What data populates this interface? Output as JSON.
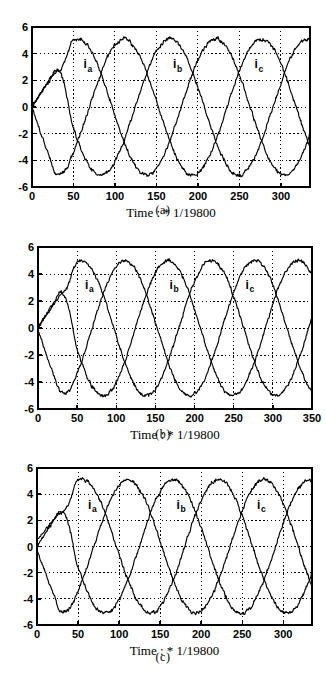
{
  "figure": {
    "type": "multi-panel-plot",
    "panel_count": 3,
    "background_color": "#ffffff",
    "line_color": "#000000",
    "grid_color": "#000000",
    "grid_style": "dotted"
  },
  "panels": [
    {
      "id": "a",
      "caption": "(a)",
      "xlabel": "Time : * 1/19800",
      "ylabel": "",
      "x_ticks": [
        "0",
        "50",
        "100",
        "150",
        "200",
        "250",
        "300"
      ],
      "y_ticks": [
        "6",
        "4",
        "2",
        "0",
        "-2",
        "-4",
        "-6"
      ],
      "series_labels": [
        "i",
        "i",
        "i"
      ],
      "series_subscripts": [
        "a",
        "b",
        "c"
      ],
      "label_a": "a",
      "label_b": "b",
      "label_c": "c",
      "label_i": "i"
    },
    {
      "id": "b",
      "caption": "(b)",
      "xlabel": "Time : * 1/19800",
      "ylabel": "",
      "x_ticks": [
        "0",
        "50",
        "100",
        "150",
        "200",
        "250",
        "300",
        "350"
      ],
      "y_ticks": [
        "6",
        "4",
        "2",
        "0",
        "-2",
        "-4",
        "-6"
      ],
      "series_labels": [
        "i",
        "i",
        "i"
      ],
      "series_subscripts": [
        "a",
        "b",
        "c"
      ],
      "label_a": "a",
      "label_b": "b",
      "label_c": "c",
      "label_i": "i"
    },
    {
      "id": "c",
      "caption": "(c)",
      "xlabel": "Time : * 1/19800",
      "ylabel": "",
      "x_ticks": [
        "0",
        "50",
        "100",
        "150",
        "200",
        "250",
        "300"
      ],
      "y_ticks": [
        "6",
        "4",
        "2",
        "0",
        "-2",
        "-4",
        "-6"
      ],
      "series_labels": [
        "i",
        "i",
        "i"
      ],
      "series_subscripts": [
        "a",
        "b",
        "c"
      ],
      "label_a": "a",
      "label_b": "b",
      "label_c": "c",
      "label_i": "i"
    }
  ],
  "chart_data": [
    {
      "type": "line",
      "title": "",
      "xlabel": "Time : * 1/19800",
      "ylabel": "",
      "xlim": [
        0,
        335
      ],
      "ylim": [
        -6,
        6
      ],
      "x_ticks": [
        0,
        50,
        100,
        150,
        200,
        250,
        300
      ],
      "y_ticks": [
        -6,
        -4,
        -2,
        0,
        2,
        4,
        6
      ],
      "grid": true,
      "legend": "inline-annotations",
      "annotations": [
        {
          "text": "ia",
          "x": 62,
          "y": 2.9
        },
        {
          "text": "ib",
          "x": 170,
          "y": 2.9
        },
        {
          "text": "ic",
          "x": 268,
          "y": 2.9
        }
      ],
      "amplitude": 5.1,
      "period": 166,
      "noise_amplitude": 0.18,
      "series": [
        {
          "name": "ia",
          "phase_deg": 90,
          "startup": "ramps from 0 up to ~2.8 by t=28 then follows steady sinusoid",
          "x": [
            0,
            10,
            20,
            28,
            40,
            55,
            70,
            85,
            100,
            115,
            130,
            145,
            160,
            175,
            190,
            205,
            220,
            235,
            250,
            265,
            280,
            295,
            310,
            325,
            335
          ],
          "values": [
            0.0,
            1.1,
            2.1,
            2.8,
            1.9,
            0.6,
            -1.2,
            -2.9,
            -4.3,
            -5.0,
            -5.1,
            -4.6,
            -3.4,
            -1.7,
            0.3,
            2.2,
            3.8,
            4.8,
            5.1,
            4.7,
            3.6,
            1.9,
            -0.1,
            -2.1,
            -3.1
          ]
        },
        {
          "name": "ib",
          "phase_deg": -30,
          "startup": "ramps from 0 upward reaching ~4.9 near t=85",
          "x": [
            0,
            10,
            20,
            28,
            40,
            55,
            70,
            85,
            100,
            115,
            130,
            145,
            160,
            175,
            190,
            205,
            220,
            235,
            250,
            265,
            280,
            295,
            310,
            325,
            335
          ],
          "values": [
            0.1,
            0.9,
            2.0,
            2.6,
            3.5,
            4.4,
            4.9,
            5.1,
            4.9,
            4.2,
            3.0,
            1.4,
            -0.5,
            -2.4,
            -3.9,
            -4.8,
            -5.2,
            -5.0,
            -4.2,
            -2.9,
            -1.2,
            0.8,
            2.7,
            4.2,
            4.8
          ]
        },
        {
          "name": "ic",
          "phase_deg": 210,
          "startup": "drops from 0 steeply to ~-5.0 by t=28",
          "x": [
            0,
            10,
            20,
            28,
            40,
            55,
            70,
            85,
            100,
            115,
            130,
            145,
            160,
            175,
            190,
            205,
            220,
            235,
            250,
            265,
            280,
            295,
            310,
            325,
            335
          ],
          "values": [
            -0.1,
            -1.9,
            -3.7,
            -5.0,
            -4.9,
            -4.7,
            -4.2,
            -3.2,
            -1.8,
            -0.1,
            1.7,
            3.3,
            4.4,
            5.0,
            5.1,
            4.6,
            3.5,
            1.9,
            0.0,
            -1.9,
            -3.5,
            -4.6,
            -5.1,
            -4.9,
            -4.5
          ]
        }
      ]
    },
    {
      "type": "line",
      "title": "",
      "xlabel": "Time : * 1/19800",
      "ylabel": "",
      "xlim": [
        0,
        350
      ],
      "ylim": [
        -6,
        6
      ],
      "x_ticks": [
        0,
        50,
        100,
        150,
        200,
        250,
        300,
        350
      ],
      "y_ticks": [
        -6,
        -4,
        -2,
        0,
        2,
        4,
        6
      ],
      "grid": true,
      "legend": "inline-annotations",
      "annotations": [
        {
          "text": "ia",
          "x": 60,
          "y": 2.9
        },
        {
          "text": "ib",
          "x": 168,
          "y": 2.9
        },
        {
          "text": "ic",
          "x": 265,
          "y": 2.9
        }
      ],
      "amplitude": 5.0,
      "period": 166,
      "noise_amplitude": 0.16,
      "series": [
        {
          "name": "ia",
          "phase_deg": 90,
          "startup": "ramps from 0 up to ~2.6 by t=28 then follows steady sinusoid",
          "x": [
            0,
            10,
            20,
            28,
            40,
            55,
            70,
            85,
            100,
            115,
            130,
            145,
            160,
            175,
            190,
            205,
            220,
            235,
            250,
            265,
            280,
            295,
            310,
            325,
            335
          ],
          "values": [
            0.0,
            1.0,
            2.0,
            2.6,
            1.8,
            0.5,
            -1.3,
            -3.0,
            -4.2,
            -4.9,
            -5.0,
            -4.6,
            -3.4,
            -1.7,
            0.2,
            2.1,
            3.7,
            4.7,
            5.0,
            4.6,
            3.5,
            1.8,
            -0.2,
            -2.0,
            -3.0
          ]
        },
        {
          "name": "ib",
          "phase_deg": -30,
          "startup": "ramps from 0 upward reaching ~4.9 near t=85",
          "x": [
            0,
            10,
            20,
            28,
            40,
            55,
            70,
            85,
            100,
            115,
            130,
            145,
            160,
            175,
            190,
            205,
            220,
            235,
            250,
            265,
            280,
            295,
            310,
            325,
            335
          ],
          "values": [
            0.0,
            0.9,
            1.9,
            2.5,
            3.4,
            4.3,
            4.8,
            5.0,
            4.8,
            4.1,
            2.9,
            1.3,
            -0.6,
            -2.4,
            -3.9,
            -4.8,
            -5.1,
            -4.9,
            -4.1,
            -2.8,
            -1.1,
            0.9,
            2.7,
            4.1,
            4.7
          ]
        },
        {
          "name": "ic",
          "phase_deg": 210,
          "startup": "drops from 0 steeply to ~-4.8 by t=28",
          "x": [
            0,
            10,
            20,
            28,
            40,
            55,
            70,
            85,
            100,
            115,
            130,
            145,
            160,
            175,
            190,
            205,
            220,
            235,
            250,
            265,
            280,
            295,
            310,
            325,
            335
          ],
          "values": [
            -0.2,
            -2.0,
            -3.6,
            -4.8,
            -4.8,
            -4.6,
            -4.1,
            -3.1,
            -1.7,
            0.0,
            1.8,
            3.3,
            4.4,
            4.9,
            5.0,
            4.6,
            3.4,
            1.8,
            -0.1,
            -2.0,
            -3.5,
            -4.6,
            -5.0,
            -4.8,
            -4.4
          ]
        }
      ]
    },
    {
      "type": "line",
      "title": "",
      "xlabel": "Time : * 1/19800",
      "ylabel": "",
      "xlim": [
        0,
        335
      ],
      "ylim": [
        -6,
        6
      ],
      "x_ticks": [
        0,
        50,
        100,
        150,
        200,
        250,
        300
      ],
      "y_ticks": [
        -6,
        -4,
        -2,
        0,
        2,
        4,
        6
      ],
      "grid": true,
      "legend": "inline-annotations",
      "annotations": [
        {
          "text": "ia",
          "x": 62,
          "y": 2.9
        },
        {
          "text": "ib",
          "x": 170,
          "y": 2.9
        },
        {
          "text": "ic",
          "x": 268,
          "y": 2.9
        }
      ],
      "amplitude": 5.1,
      "period": 166,
      "noise_amplitude": 0.18,
      "series": [
        {
          "name": "ia",
          "phase_deg": 90,
          "startup": "ramps from 0 up to ~2.7 by t=28 then follows steady sinusoid",
          "x": [
            0,
            10,
            20,
            28,
            40,
            55,
            70,
            85,
            100,
            115,
            130,
            145,
            160,
            175,
            190,
            205,
            220,
            235,
            250,
            265,
            280,
            295,
            310,
            325,
            335
          ],
          "values": [
            0.0,
            1.1,
            2.1,
            2.7,
            1.9,
            0.6,
            -1.2,
            -2.9,
            -4.3,
            -5.0,
            -5.1,
            -4.6,
            -3.4,
            -1.7,
            0.3,
            2.2,
            3.8,
            4.8,
            5.1,
            4.7,
            3.6,
            1.9,
            -0.1,
            -2.1,
            -3.1
          ]
        },
        {
          "name": "ib",
          "phase_deg": -30,
          "startup": "ramps from 0 upward reaching ~5.1 near t=85",
          "x": [
            0,
            10,
            20,
            28,
            40,
            55,
            70,
            85,
            100,
            115,
            130,
            145,
            160,
            175,
            190,
            205,
            220,
            235,
            250,
            265,
            280,
            295,
            310,
            325,
            335
          ],
          "values": [
            0.5,
            1.2,
            2.1,
            2.6,
            3.5,
            4.4,
            4.9,
            5.1,
            4.9,
            4.2,
            3.0,
            1.4,
            -0.5,
            -2.4,
            -3.9,
            -4.8,
            -5.2,
            -5.0,
            -4.2,
            -2.9,
            -1.2,
            0.8,
            2.7,
            4.2,
            4.8
          ]
        },
        {
          "name": "ic",
          "phase_deg": 210,
          "startup": "drops from 0 steeply to ~-5.0 by t=28",
          "x": [
            0,
            10,
            20,
            28,
            40,
            55,
            70,
            85,
            100,
            115,
            130,
            145,
            160,
            175,
            190,
            205,
            220,
            235,
            250,
            265,
            280,
            295,
            310,
            325,
            335
          ],
          "values": [
            -0.3,
            -2.0,
            -3.8,
            -5.0,
            -4.9,
            -4.7,
            -4.2,
            -3.2,
            -1.8,
            -0.1,
            1.7,
            3.3,
            4.4,
            5.0,
            5.1,
            4.6,
            3.5,
            1.9,
            0.0,
            -1.9,
            -3.5,
            -4.6,
            -5.1,
            -4.9,
            -4.5
          ]
        }
      ]
    }
  ]
}
